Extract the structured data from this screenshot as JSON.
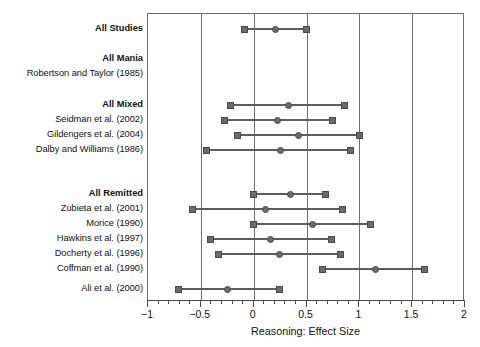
{
  "chart_data": {
    "type": "scatter",
    "title": "",
    "xlabel": "Reasoning: Effect Size",
    "ylabel": "",
    "xlim": [
      -1,
      2
    ],
    "grid": true,
    "gridlines_x": [
      -1,
      -0.5,
      0,
      0.5,
      1,
      1.5,
      2
    ],
    "xticks_major": [
      -1,
      -0.5,
      0,
      0.5,
      1,
      1.5,
      2
    ],
    "xtick_labels": [
      "−1",
      "−0.5",
      "0",
      "0.5",
      "1",
      "1.5",
      "2"
    ],
    "xticks_minor_step": 0.1,
    "legend": null,
    "marker_center": "circle",
    "marker_bound": "square",
    "colors": {
      "marker": "#6b6b6b",
      "marker_edge": "#4a4a4a",
      "line": "#5d5d5d",
      "axis": "#4a4a4a",
      "grid": "#6d6d6d",
      "text": "#111111"
    },
    "rows": [
      {
        "label": "All Studies",
        "group": true,
        "y": 28,
        "low": -0.09,
        "est": 0.21,
        "high": 0.5
      },
      {
        "label": "All Mania",
        "group": true,
        "y": 58,
        "low": null,
        "est": null,
        "high": null
      },
      {
        "label": "Robertson and Taylor (1985)",
        "group": false,
        "y": 73,
        "low": null,
        "est": null,
        "high": null
      },
      {
        "label": "All Mixed",
        "group": true,
        "y": 104,
        "low": -0.22,
        "est": 0.33,
        "high": 0.86
      },
      {
        "label": "Seidman et al. (2002)",
        "group": false,
        "y": 119,
        "low": -0.28,
        "est": 0.23,
        "high": 0.75
      },
      {
        "label": "Gildengers et al. (2004)",
        "group": false,
        "y": 134,
        "low": -0.15,
        "est": 0.42,
        "high": 1.0
      },
      {
        "label": "Dalby and Williams (1986)",
        "group": false,
        "y": 149,
        "low": -0.45,
        "est": 0.25,
        "high": 0.92
      },
      {
        "label": "All Remitted",
        "group": true,
        "y": 193,
        "low": 0.0,
        "est": 0.35,
        "high": 0.68
      },
      {
        "label": "Zubieta et al. (2001)",
        "group": false,
        "y": 208,
        "low": -0.58,
        "est": 0.11,
        "high": 0.84
      },
      {
        "label": "Morice (1990)",
        "group": false,
        "y": 223,
        "low": 0.0,
        "est": 0.56,
        "high": 1.11
      },
      {
        "label": "Hawkins et al. (1997)",
        "group": false,
        "y": 238,
        "low": -0.41,
        "est": 0.16,
        "high": 0.74
      },
      {
        "label": "Docherty et al. (1996)",
        "group": false,
        "y": 253,
        "low": -0.33,
        "est": 0.24,
        "high": 0.82
      },
      {
        "label": "Coffman et al. (1990)",
        "group": false,
        "y": 268,
        "low": 0.65,
        "est": 1.15,
        "high": 1.62
      },
      {
        "label": "Ali et al. (2000)",
        "group": false,
        "y": 288,
        "low": -0.71,
        "est": -0.25,
        "high": 0.24
      }
    ]
  }
}
